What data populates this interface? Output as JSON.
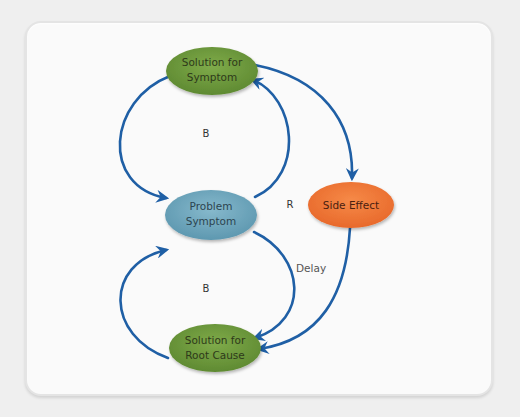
{
  "colors": {
    "background": "#efefef",
    "panel": "#fafafa",
    "arrow": "#1f5fa5",
    "green_node": "#6f9a3e",
    "green_node_text": "#2e3a1a",
    "blue_node": "#6fa8bf",
    "blue_node_text": "#2c4550",
    "orange_node": "#f07a3a",
    "orange_node_text": "#4a2010"
  },
  "nodes": {
    "solution_symptom": {
      "line1": "Solution for",
      "line2": "Symptom"
    },
    "problem_symptom": {
      "line1": "Problem",
      "line2": "Symptom"
    },
    "solution_root": {
      "line1": "Solution for",
      "line2": "Root Cause"
    },
    "side_effect": {
      "label": "Side Effect"
    }
  },
  "loop_labels": {
    "top_balancing": "B",
    "bottom_balancing": "B",
    "reinforcing": "R"
  },
  "edge_labels": {
    "delay": "Delay"
  }
}
